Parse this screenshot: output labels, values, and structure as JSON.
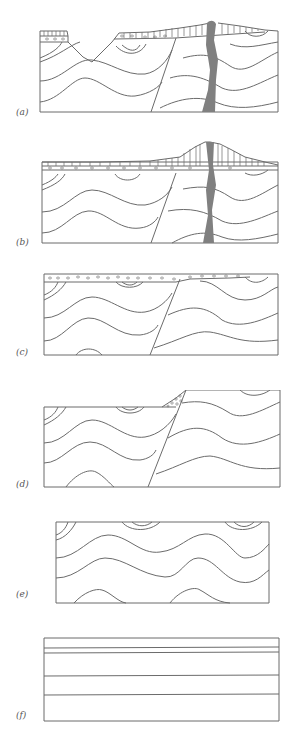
{
  "figure": {
    "type": "geologic-cross-section-sequence",
    "panels": [
      {
        "id": "a",
        "label": "(a)",
        "description": "Present-day section: eroded valley, lava flow cap, dike cutting folds and fault"
      },
      {
        "id": "b",
        "label": "(b)",
        "description": "Lava flow and volcanic cone fed by dike over conglomerate layer"
      },
      {
        "id": "c",
        "label": "(c)",
        "description": "Erosion surface with conglomerate deposited over faulted folds"
      },
      {
        "id": "d",
        "label": "(d)",
        "description": "Normal fault offsetting folded strata with fault breccia wedge"
      },
      {
        "id": "e",
        "label": "(e)",
        "description": "Folded strata (anticlines and synclines)"
      },
      {
        "id": "f",
        "label": "(f)",
        "description": "Original horizontal sedimentary layers"
      }
    ]
  },
  "colors": {
    "line": "#6b6b6b",
    "dike": "#808080",
    "background": "#ffffff"
  }
}
